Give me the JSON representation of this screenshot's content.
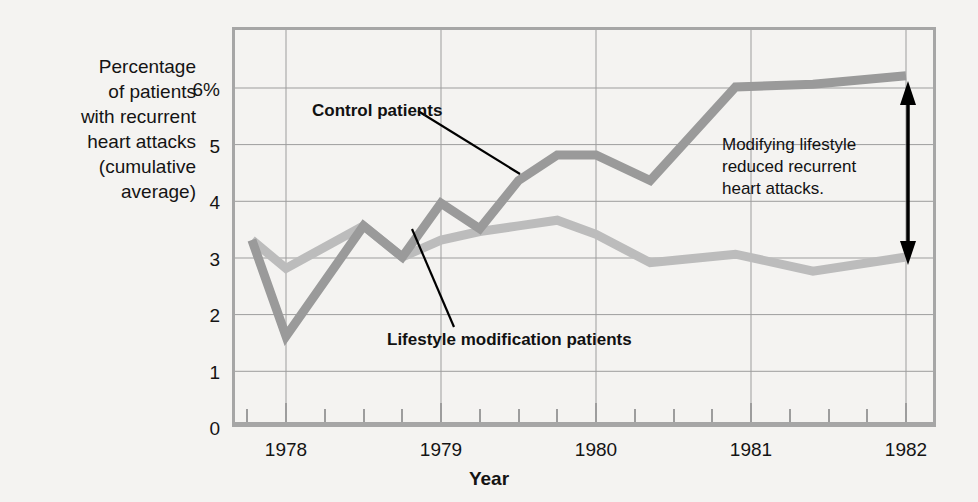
{
  "axes": {
    "y_title": "Percentage of patients with recurrent heart attacks (cumulative average)",
    "y_title_lines": [
      "Percentage",
      "of patients",
      "with recurrent",
      "heart attacks",
      "(cumulative",
      "average)"
    ],
    "x_title": "Year",
    "y_ticks": [
      "6%",
      "5",
      "4",
      "3",
      "2",
      "1",
      "0"
    ],
    "x_ticks": [
      "1978",
      "1979",
      "1980",
      "1981",
      "1982"
    ]
  },
  "annotations": {
    "control_label": "Control patients",
    "lifestyle_label": "Lifestyle modification patients",
    "note_lines": [
      "Modifying lifestyle",
      "reduced recurrent",
      "heart attacks."
    ],
    "note_text": "Modifying lifestyle reduced recurrent heart attacks."
  },
  "colors": {
    "control_line": "#9a9a9a",
    "lifestyle_line": "#bcbcbc",
    "gridline": "#9d9d9d",
    "axis": "#a6a6a6",
    "text": "#141414",
    "background": "#f4f3f1",
    "arrow": "#000000"
  },
  "chart_data": {
    "type": "line",
    "title": "",
    "xlabel": "Year",
    "ylabel": "Percentage of patients with recurrent heart attacks (cumulative average)",
    "xlim": [
      1977.75,
      1982.1
    ],
    "ylim": [
      0,
      6.6
    ],
    "yticks": [
      0,
      1,
      2,
      3,
      4,
      5,
      6
    ],
    "xticks": [
      1978,
      1979,
      1980,
      1981,
      1982
    ],
    "grid": true,
    "legend": "inline-labels",
    "series": [
      {
        "name": "Control patients",
        "color": "#9a9a9a",
        "x": [
          1977.78,
          1978.0,
          1978.5,
          1978.75,
          1979.0,
          1979.25,
          1979.5,
          1979.75,
          1980.0,
          1980.35,
          1980.9,
          1981.4,
          1982.0
        ],
        "values": [
          3.3,
          1.6,
          3.55,
          3.0,
          3.95,
          3.5,
          4.35,
          4.8,
          4.8,
          4.35,
          6.0,
          6.05,
          6.2
        ]
      },
      {
        "name": "Lifestyle modification patients",
        "color": "#bcbcbc",
        "x": [
          1977.78,
          1978.0,
          1978.5,
          1978.75,
          1979.0,
          1979.25,
          1979.5,
          1979.75,
          1980.0,
          1980.35,
          1980.9,
          1981.4,
          1982.0
        ],
        "values": [
          3.3,
          2.8,
          3.55,
          3.0,
          3.3,
          3.45,
          3.55,
          3.65,
          3.4,
          2.9,
          3.05,
          2.75,
          3.0
        ]
      }
    ],
    "annotation": {
      "text": "Modifying lifestyle reduced recurrent heart attacks.",
      "arrow_x": 1982.0,
      "arrow_y_top": 6.2,
      "arrow_y_bottom": 3.0
    }
  }
}
